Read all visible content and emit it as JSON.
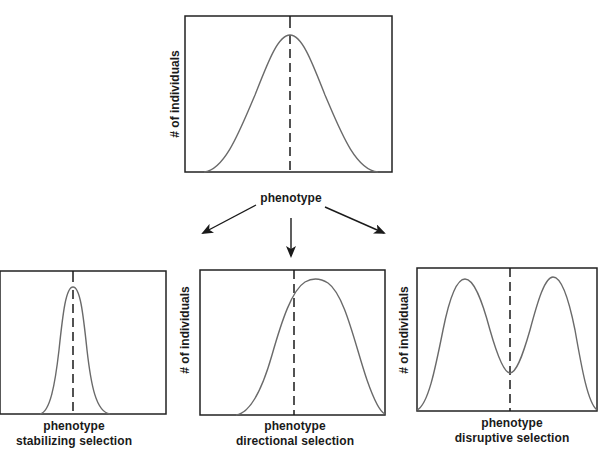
{
  "figure": {
    "top_panel": {
      "y_label": "# of individuals",
      "x_label": "phenotype"
    },
    "arrows": [
      "left",
      "down",
      "right"
    ],
    "panels": [
      {
        "id": "stabilizing",
        "x_label": "phenotype",
        "caption": "stabilizing selection",
        "y_label": ""
      },
      {
        "id": "directional",
        "x_label": "phenotype",
        "caption": "directional selection",
        "y_label": "# of individuals"
      },
      {
        "id": "disruptive",
        "x_label": "phenotype",
        "caption": "disruptive selection",
        "y_label": "# of individuals"
      }
    ]
  },
  "colors": {
    "frame": "#222222",
    "curve": "#6a6a6a",
    "mean_line": "#1a1a1a"
  }
}
